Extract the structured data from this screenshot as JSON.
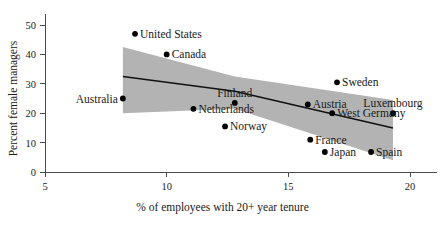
{
  "chart_data": {
    "type": "scatter",
    "title": "",
    "xlabel": "% of employees with 20+ year tenure",
    "ylabel": "Percent female managers",
    "xlim": [
      5,
      20
    ],
    "ylim": [
      0,
      52
    ],
    "xticks": [
      5,
      10,
      15,
      20
    ],
    "yticks": [
      0,
      10,
      20,
      30,
      40,
      50
    ],
    "grid": false,
    "legend": "none",
    "points": [
      {
        "label": "United States",
        "x": 8.7,
        "y": 47.0,
        "label_side": "right"
      },
      {
        "label": "Canada",
        "x": 10.0,
        "y": 40.0,
        "label_side": "right"
      },
      {
        "label": "Australia",
        "x": 8.2,
        "y": 25.0,
        "label_side": "left"
      },
      {
        "label": "Netherlands",
        "x": 11.1,
        "y": 21.5,
        "label_side": "right"
      },
      {
        "label": "Norway",
        "x": 12.4,
        "y": 15.5,
        "label_side": "right"
      },
      {
        "label": "Finland",
        "x": 12.8,
        "y": 23.5,
        "label_side": "above"
      },
      {
        "label": "Austria",
        "x": 15.8,
        "y": 23.0,
        "label_side": "right"
      },
      {
        "label": "Sweden",
        "x": 17.0,
        "y": 30.5,
        "label_side": "right"
      },
      {
        "label": "West Germany",
        "x": 16.8,
        "y": 20.0,
        "label_side": "right"
      },
      {
        "label": "Luxembourg",
        "x": 19.3,
        "y": 20.0,
        "label_side": "above"
      },
      {
        "label": "France",
        "x": 15.9,
        "y": 11.0,
        "label_side": "right"
      },
      {
        "label": "Japan",
        "x": 16.5,
        "y": 6.8,
        "label_side": "right"
      },
      {
        "label": "Spain",
        "x": 18.4,
        "y": 6.8,
        "label_side": "right"
      }
    ],
    "fit_line": {
      "name": "linear fit",
      "x": [
        8.2,
        12.8,
        19.3
      ],
      "y": [
        32.5,
        27.5,
        15.0
      ]
    },
    "confidence_band": {
      "name": "95% confidence band",
      "x": [
        8.2,
        12.8,
        19.3
      ],
      "upper": [
        42.5,
        32.5,
        24.5
      ],
      "lower": [
        20.0,
        21.5,
        4.0
      ]
    },
    "colors": {
      "point": "#000000",
      "band": "#b3b3b3",
      "line": "#111111",
      "axis": "#4c4c4c",
      "text": "#1a1a1a",
      "background": "#ffffff"
    }
  }
}
